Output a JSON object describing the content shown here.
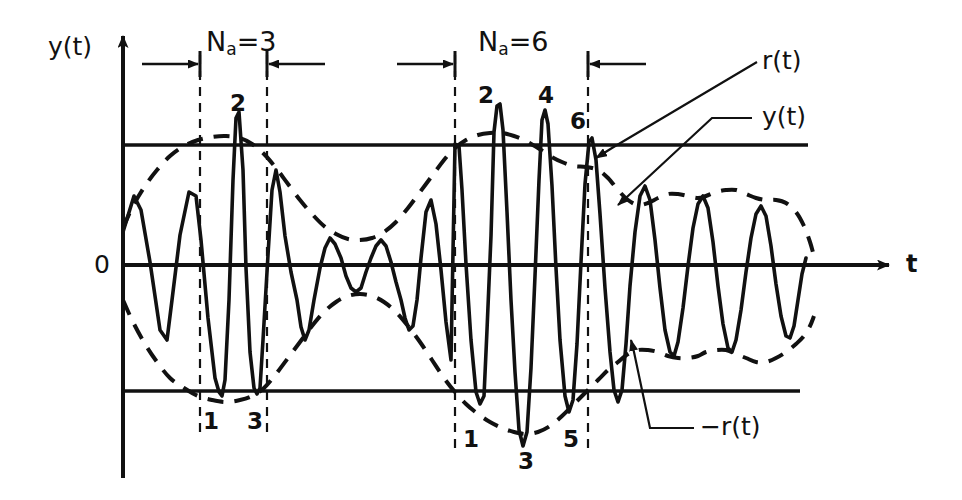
{
  "figure": {
    "kind": "signal-envelope-diagram",
    "background_color": "#ffffff",
    "stroke_color": "#111111",
    "width": 962,
    "height": 500
  },
  "axes": {
    "y_axis_label": "y(t)",
    "x_axis_label": "t",
    "origin_label": "0",
    "y_axis_x": 123,
    "x_axis_y": 265,
    "x_axis_end": 895,
    "y_axis_top": 32,
    "y_axis_bottom": 478,
    "threshold_upper_y": 145,
    "threshold_lower_y": 391,
    "threshold_line_start": 123,
    "threshold_upper_end": 808,
    "threshold_lower_end": 800
  },
  "intervals": [
    {
      "name": "interval-na-3",
      "label": "N",
      "label_sub": "a",
      "label_eq": "=3",
      "label_x": 206,
      "label_y": 28,
      "left_x": 200,
      "right_x": 267,
      "arrow_y": 64,
      "dash_top": 55,
      "dash_bottom": 438
    },
    {
      "name": "interval-na-6",
      "label": "N",
      "label_sub": "a",
      "label_eq": "=6",
      "label_x": 478,
      "label_y": 28,
      "left_x": 455,
      "right_x": 588,
      "arrow_y": 64,
      "dash_top": 55,
      "dash_bottom": 455
    }
  ],
  "peak_numbers": [
    {
      "text": "2",
      "x": 230,
      "y": 92
    },
    {
      "text": "1",
      "x": 203,
      "y": 410
    },
    {
      "text": "3",
      "x": 247,
      "y": 410
    },
    {
      "text": "2",
      "x": 478,
      "y": 84
    },
    {
      "text": "4",
      "x": 538,
      "y": 84
    },
    {
      "text": "6",
      "x": 570,
      "y": 110
    },
    {
      "text": "1",
      "x": 463,
      "y": 428
    },
    {
      "text": "3",
      "x": 518,
      "y": 450
    },
    {
      "text": "5",
      "x": 563,
      "y": 428
    }
  ],
  "callouts": [
    {
      "name": "callout-r-t",
      "text": "r(t)",
      "label_x": 762,
      "label_y": 48,
      "leader": [
        [
          757,
          62
        ],
        [
          612,
          148
        ]
      ],
      "arrow_tip": [
        596,
        158
      ]
    },
    {
      "name": "callout-y-t",
      "text": "y(t)",
      "label_x": 762,
      "label_y": 104,
      "leader": [
        [
          752,
          118
        ],
        [
          712,
          118
        ],
        [
          628,
          196
        ]
      ],
      "arrow_tip": [
        618,
        205
      ]
    },
    {
      "name": "callout-neg-r-t",
      "text": "−r(t)",
      "label_x": 700,
      "label_y": 414,
      "leader": [
        [
          694,
          428
        ],
        [
          650,
          428
        ],
        [
          634,
          352
        ]
      ],
      "arrow_tip": [
        631,
        340
      ]
    }
  ],
  "chart_data": {
    "type": "line",
    "title": "",
    "xlabel": "t",
    "ylabel": "y(t)",
    "grid": false,
    "legend": [
      "y(t)",
      "r(t)",
      "-r(t)"
    ],
    "legend_position": "annotations-right",
    "axis_ranges": {
      "x": [
        123,
        895
      ],
      "y_pixels": [
        32,
        478
      ],
      "zero_y": 265
    },
    "reference_levels": {
      "upper_threshold": 145,
      "lower_threshold": 391
    },
    "series": [
      {
        "name": "y(t)",
        "style": "solid",
        "points": [
          [
            123,
            232
          ],
          [
            134,
            196
          ],
          [
            141,
            210
          ],
          [
            150,
            262
          ],
          [
            160,
            330
          ],
          [
            167,
            340
          ],
          [
            172,
            300
          ],
          [
            180,
            235
          ],
          [
            189,
            192
          ],
          [
            196,
            196
          ],
          [
            201,
            240
          ],
          [
            208,
            318
          ],
          [
            215,
            378
          ],
          [
            219,
            392
          ],
          [
            222,
            396
          ],
          [
            225,
            380
          ],
          [
            229,
            300
          ],
          [
            233,
            180
          ],
          [
            236,
            118
          ],
          [
            239,
            112
          ],
          [
            243,
            170
          ],
          [
            246,
            268
          ],
          [
            250,
            352
          ],
          [
            254,
            388
          ],
          [
            257,
            394
          ],
          [
            260,
            388
          ],
          [
            263,
            340
          ],
          [
            268,
            255
          ],
          [
            272,
            190
          ],
          [
            276,
            170
          ],
          [
            280,
            192
          ],
          [
            285,
            236
          ],
          [
            291,
            272
          ],
          [
            297,
            300
          ],
          [
            301,
            327
          ],
          [
            305,
            340
          ],
          [
            309,
            330
          ],
          [
            314,
            300
          ],
          [
            320,
            268
          ],
          [
            325,
            248
          ],
          [
            330,
            238
          ],
          [
            335,
            244
          ],
          [
            341,
            258
          ],
          [
            346,
            276
          ],
          [
            351,
            288
          ],
          [
            356,
            292
          ],
          [
            361,
            288
          ],
          [
            366,
            272
          ],
          [
            371,
            258
          ],
          [
            376,
            246
          ],
          [
            381,
            240
          ],
          [
            386,
            246
          ],
          [
            391,
            262
          ],
          [
            396,
            282
          ],
          [
            401,
            300
          ],
          [
            405,
            318
          ],
          [
            409,
            330
          ],
          [
            413,
            326
          ],
          [
            417,
            300
          ],
          [
            421,
            258
          ],
          [
            426,
            212
          ],
          [
            431,
            200
          ],
          [
            436,
            224
          ],
          [
            441,
            270
          ],
          [
            446,
            322
          ],
          [
            451,
            360
          ],
          [
            455,
            144
          ],
          [
            459,
            146
          ],
          [
            462,
            190
          ],
          [
            466,
            264
          ],
          [
            471,
            340
          ],
          [
            476,
            392
          ],
          [
            480,
            404
          ],
          [
            484,
            396
          ],
          [
            487,
            330
          ],
          [
            491,
            236
          ],
          [
            494,
            132
          ],
          [
            497,
            106
          ],
          [
            500,
            104
          ],
          [
            503,
            130
          ],
          [
            507,
            212
          ],
          [
            511,
            300
          ],
          [
            515,
            372
          ],
          [
            519,
            430
          ],
          [
            523,
            446
          ],
          [
            527,
            432
          ],
          [
            531,
            368
          ],
          [
            535,
            276
          ],
          [
            539,
            180
          ],
          [
            542,
            120
          ],
          [
            545,
            110
          ],
          [
            548,
            124
          ],
          [
            552,
            186
          ],
          [
            556,
            268
          ],
          [
            560,
            340
          ],
          [
            565,
            396
          ],
          [
            569,
            412
          ],
          [
            573,
            400
          ],
          [
            577,
            344
          ],
          [
            581,
            262
          ],
          [
            585,
            184
          ],
          [
            589,
            142
          ],
          [
            592,
            138
          ],
          [
            596,
            160
          ],
          [
            600,
            214
          ],
          [
            605,
            288
          ],
          [
            610,
            352
          ],
          [
            614,
            390
          ],
          [
            618,
            402
          ],
          [
            622,
            390
          ],
          [
            626,
            344
          ],
          [
            630,
            286
          ],
          [
            635,
            232
          ],
          [
            640,
            196
          ],
          [
            645,
            186
          ],
          [
            650,
            200
          ],
          [
            655,
            240
          ],
          [
            660,
            288
          ],
          [
            665,
            330
          ],
          [
            670,
            352
          ],
          [
            674,
            356
          ],
          [
            678,
            342
          ],
          [
            683,
            308
          ],
          [
            688,
            266
          ],
          [
            693,
            228
          ],
          [
            698,
            204
          ],
          [
            703,
            196
          ],
          [
            708,
            208
          ],
          [
            713,
            242
          ],
          [
            718,
            286
          ],
          [
            723,
            324
          ],
          [
            728,
            348
          ],
          [
            732,
            352
          ],
          [
            736,
            340
          ],
          [
            741,
            310
          ],
          [
            746,
            272
          ],
          [
            751,
            238
          ],
          [
            756,
            214
          ],
          [
            761,
            206
          ],
          [
            766,
            216
          ],
          [
            771,
            246
          ],
          [
            776,
            284
          ],
          [
            781,
            316
          ],
          [
            786,
            336
          ],
          [
            790,
            338
          ],
          [
            794,
            326
          ],
          [
            798,
            300
          ],
          [
            802,
            274
          ],
          [
            806,
            258
          ]
        ]
      },
      {
        "name": "r(t)",
        "style": "dashed",
        "description": "upper envelope",
        "points": [
          [
            123,
            228
          ],
          [
            133,
            206
          ],
          [
            145,
            186
          ],
          [
            157,
            170
          ],
          [
            170,
            156
          ],
          [
            184,
            146
          ],
          [
            198,
            140
          ],
          [
            212,
            137
          ],
          [
            226,
            136
          ],
          [
            240,
            138
          ],
          [
            252,
            144
          ],
          [
            264,
            154
          ],
          [
            276,
            168
          ],
          [
            288,
            184
          ],
          [
            300,
            200
          ],
          [
            312,
            214
          ],
          [
            324,
            226
          ],
          [
            336,
            234
          ],
          [
            348,
            239
          ],
          [
            360,
            240
          ],
          [
            372,
            238
          ],
          [
            384,
            232
          ],
          [
            396,
            222
          ],
          [
            408,
            208
          ],
          [
            420,
            192
          ],
          [
            432,
            176
          ],
          [
            444,
            160
          ],
          [
            455,
            148
          ],
          [
            466,
            140
          ],
          [
            478,
            135
          ],
          [
            490,
            133
          ],
          [
            502,
            133
          ],
          [
            514,
            136
          ],
          [
            526,
            141
          ],
          [
            538,
            148
          ],
          [
            550,
            156
          ],
          [
            562,
            162
          ],
          [
            574,
            166
          ],
          [
            586,
            167
          ],
          [
            598,
            170
          ],
          [
            608,
            178
          ],
          [
            618,
            190
          ],
          [
            628,
            200
          ],
          [
            638,
            205
          ],
          [
            648,
            203
          ],
          [
            658,
            198
          ],
          [
            668,
            194
          ],
          [
            678,
            194
          ],
          [
            688,
            196
          ],
          [
            698,
            198
          ],
          [
            706,
            196
          ],
          [
            716,
            192
          ],
          [
            726,
            190
          ],
          [
            736,
            190
          ],
          [
            746,
            194
          ],
          [
            756,
            198
          ],
          [
            766,
            200
          ],
          [
            776,
            200
          ],
          [
            786,
            203
          ],
          [
            796,
            212
          ],
          [
            804,
            226
          ],
          [
            810,
            242
          ],
          [
            814,
            256
          ]
        ]
      },
      {
        "name": "-r(t)",
        "style": "dashed",
        "description": "lower envelope",
        "points": [
          [
            123,
            300
          ],
          [
            133,
            322
          ],
          [
            145,
            344
          ],
          [
            157,
            362
          ],
          [
            170,
            378
          ],
          [
            184,
            388
          ],
          [
            198,
            396
          ],
          [
            212,
            400
          ],
          [
            226,
            402
          ],
          [
            240,
            400
          ],
          [
            252,
            396
          ],
          [
            264,
            388
          ],
          [
            276,
            374
          ],
          [
            288,
            358
          ],
          [
            300,
            342
          ],
          [
            312,
            326
          ],
          [
            324,
            312
          ],
          [
            336,
            302
          ],
          [
            348,
            296
          ],
          [
            360,
            294
          ],
          [
            372,
            296
          ],
          [
            384,
            302
          ],
          [
            396,
            312
          ],
          [
            408,
            326
          ],
          [
            420,
            342
          ],
          [
            432,
            360
          ],
          [
            444,
            378
          ],
          [
            455,
            392
          ],
          [
            466,
            404
          ],
          [
            478,
            414
          ],
          [
            490,
            422
          ],
          [
            502,
            428
          ],
          [
            514,
            432
          ],
          [
            526,
            434
          ],
          [
            538,
            432
          ],
          [
            550,
            426
          ],
          [
            562,
            416
          ],
          [
            574,
            404
          ],
          [
            586,
            392
          ],
          [
            598,
            380
          ],
          [
            608,
            370
          ],
          [
            618,
            362
          ],
          [
            628,
            354
          ],
          [
            638,
            350
          ],
          [
            648,
            350
          ],
          [
            658,
            352
          ],
          [
            668,
            356
          ],
          [
            678,
            358
          ],
          [
            688,
            358
          ],
          [
            698,
            356
          ],
          [
            706,
            352
          ],
          [
            716,
            350
          ],
          [
            726,
            350
          ],
          [
            736,
            354
          ],
          [
            746,
            358
          ],
          [
            756,
            362
          ],
          [
            766,
            362
          ],
          [
            776,
            358
          ],
          [
            786,
            352
          ],
          [
            796,
            344
          ],
          [
            804,
            336
          ],
          [
            810,
            326
          ],
          [
            814,
            316
          ]
        ]
      }
    ]
  }
}
